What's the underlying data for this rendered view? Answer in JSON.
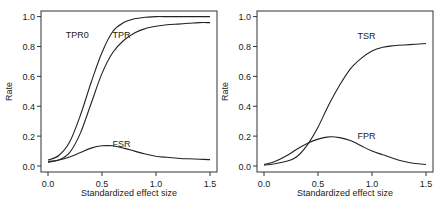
{
  "chart_data": [
    {
      "type": "line",
      "panel": "left",
      "title": "",
      "xlabel": "Standardized effect size",
      "ylabel": "Rate",
      "xlim": [
        0.0,
        1.5
      ],
      "ylim": [
        0.0,
        1.0
      ],
      "xticks": [
        "0.0",
        "0.5",
        "1.0",
        "1.5"
      ],
      "yticks": [
        "0.0",
        "0.2",
        "0.4",
        "0.6",
        "0.8",
        "1.0"
      ],
      "grid": false,
      "x": [
        0.0,
        0.1,
        0.2,
        0.3,
        0.4,
        0.5,
        0.6,
        0.7,
        0.8,
        0.9,
        1.0,
        1.1,
        1.2,
        1.3,
        1.4,
        1.5
      ],
      "series": [
        {
          "name": "TPR0",
          "values": [
            0.04,
            0.07,
            0.16,
            0.34,
            0.56,
            0.76,
            0.9,
            0.96,
            0.985,
            0.995,
            1.0,
            1.0,
            1.0,
            1.0,
            1.0,
            1.0
          ],
          "label_pos": [
            0.27,
            0.88
          ]
        },
        {
          "name": "TPR",
          "values": [
            0.025,
            0.04,
            0.09,
            0.22,
            0.42,
            0.62,
            0.76,
            0.84,
            0.89,
            0.92,
            0.935,
            0.945,
            0.95,
            0.955,
            0.96,
            0.96
          ],
          "label_pos": [
            0.68,
            0.88
          ]
        },
        {
          "name": "FSR",
          "values": [
            0.03,
            0.04,
            0.06,
            0.09,
            0.12,
            0.135,
            0.135,
            0.12,
            0.1,
            0.08,
            0.065,
            0.058,
            0.052,
            0.048,
            0.045,
            0.043
          ],
          "label_pos": [
            0.68,
            0.15
          ]
        }
      ]
    },
    {
      "type": "line",
      "panel": "right",
      "title": "",
      "xlabel": "Standardized effect size",
      "ylabel": "Rate",
      "xlim": [
        0.0,
        1.5
      ],
      "ylim": [
        0.0,
        1.0
      ],
      "xticks": [
        "0.0",
        "0.5",
        "1.0",
        "1.5"
      ],
      "yticks": [
        "0.0",
        "0.2",
        "0.4",
        "0.6",
        "0.8",
        "1.0"
      ],
      "grid": false,
      "x": [
        0.0,
        0.1,
        0.2,
        0.3,
        0.4,
        0.5,
        0.6,
        0.7,
        0.8,
        0.9,
        1.0,
        1.1,
        1.2,
        1.3,
        1.4,
        1.5
      ],
      "series": [
        {
          "name": "TSR",
          "values": [
            0.005,
            0.015,
            0.03,
            0.06,
            0.14,
            0.26,
            0.41,
            0.54,
            0.65,
            0.72,
            0.77,
            0.795,
            0.805,
            0.81,
            0.815,
            0.82
          ],
          "label_pos": [
            0.95,
            0.87
          ]
        },
        {
          "name": "FPR",
          "values": [
            0.01,
            0.03,
            0.065,
            0.11,
            0.15,
            0.18,
            0.195,
            0.19,
            0.17,
            0.135,
            0.1,
            0.075,
            0.05,
            0.03,
            0.017,
            0.01
          ],
          "label_pos": [
            0.95,
            0.2
          ]
        }
      ]
    }
  ]
}
